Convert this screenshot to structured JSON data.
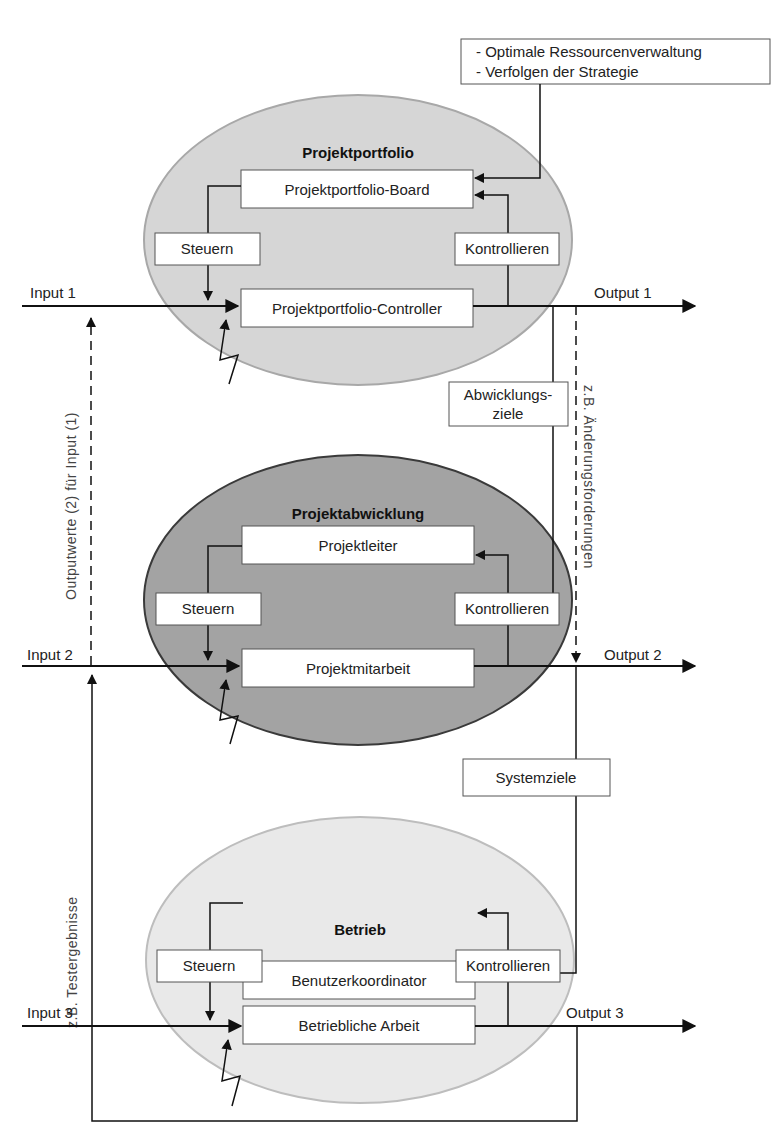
{
  "colors": {
    "portfolio_fill": "#d6d6d6",
    "portfolio_stroke": "#a8a8a8",
    "abwicklung_fill": "#a3a3a3",
    "abwicklung_stroke": "#3a3a3a",
    "betrieb_fill": "#e9e9e9",
    "betrieb_stroke": "#bdbdbd"
  },
  "strategy_note": {
    "line1": "- Optimale Ressourcenverwaltung",
    "line2": "- Verfolgen der Strategie"
  },
  "levels": [
    {
      "title": "Projektportfolio",
      "top_role": "Projektportfolio-Board",
      "bottom_role": "Projektportfolio-Controller",
      "steer_label": "Steuern",
      "control_label": "Kontrollieren",
      "input": "Input 1",
      "output": "Output 1"
    },
    {
      "title": "Projektabwicklung",
      "top_role": "Projektleiter",
      "bottom_role": "Projektmitarbeit",
      "steer_label": "Steuern",
      "control_label": "Kontrollieren",
      "input": "Input 2",
      "output": "Output 2"
    },
    {
      "title": "Betrieb",
      "top_role": "Benutzerkoordinator",
      "bottom_role": "Betriebliche Arbeit",
      "steer_label": "Steuern",
      "control_label": "Kontrollieren",
      "input": "Input 3",
      "output": "Output 3"
    }
  ],
  "connectors": {
    "abwicklungsziele_line1": "Abwicklungs-",
    "abwicklungsziele_line2": "ziele",
    "systemziele": "Systemziele",
    "feedback_outputwerte": "Outputwerte (2) für Input (1)",
    "feedback_aenderungen": "z.B. Änderungsforderungen",
    "feedback_tests": "z.B. Testergebnisse"
  }
}
